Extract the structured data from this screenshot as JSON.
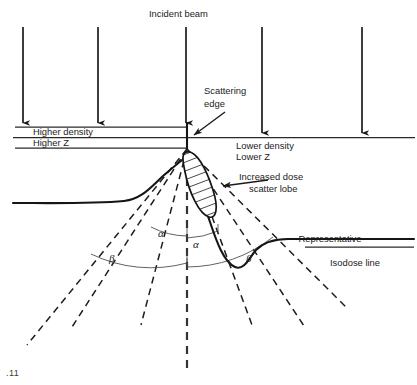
{
  "figure": {
    "domain": "diagram"
  },
  "labels": {
    "incident_beam": "Incident beam",
    "scattering_edge_line1": "Scattering",
    "scattering_edge_line2": "edge",
    "higher_density": "Higher density",
    "higher_z": "Higher Z",
    "lower_density": "Lower density",
    "lower_z": "Lower Z",
    "scatter_lobe_line1": "Increased dose",
    "scatter_lobe_line2": "scatter lobe",
    "isodose_line1": "Representative",
    "isodose_line2": "Isodose line",
    "alpha_left": "α",
    "alpha_right": "α",
    "beta_left": "β",
    "beta_right": "β",
    "caption_fragment": ".11"
  },
  "colors": {
    "ink": "#1b1b1b",
    "ink_soft": "#444444",
    "background": "#ffffff"
  },
  "geometry": {
    "scatter_point": {
      "x": 187,
      "y": 148
    },
    "interface_y": 137,
    "upper_band_y": 127,
    "lower_band_y": 148,
    "incident_beams_x": [
      23,
      98,
      186,
      262,
      362
    ],
    "beam_top_y": 26,
    "beam_left_bottom_y": 127,
    "beam_right_bottom_y": 137
  },
  "angles": {
    "alpha_label_note": "inner scatter cone half-angle",
    "beta_label_note": "outer scatter cone half-angle"
  }
}
